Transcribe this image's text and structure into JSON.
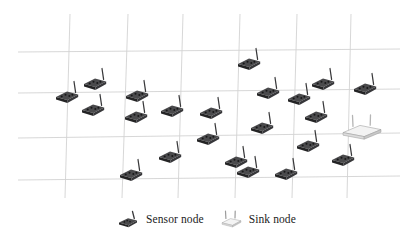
{
  "figure": {
    "type": "network-deployment-diagram",
    "background_color": "#ffffff",
    "grid": {
      "line_color": "#d2d2d2",
      "line_width": 0.9,
      "vertical_line_count": 6,
      "horizontal_line_count": 4,
      "perspective": "slight-skew",
      "vertical_lines": [
        {
          "x_top": 70,
          "y_top": 14,
          "x_bottom": 65,
          "y_bottom": 198
        },
        {
          "x_top": 128,
          "y_top": 14,
          "x_bottom": 122,
          "y_bottom": 198
        },
        {
          "x_top": 183,
          "y_top": 14,
          "x_bottom": 178,
          "y_bottom": 198
        },
        {
          "x_top": 240,
          "y_top": 14,
          "x_bottom": 235,
          "y_bottom": 198
        },
        {
          "x_top": 297,
          "y_top": 14,
          "x_bottom": 292,
          "y_bottom": 198
        },
        {
          "x_top": 351,
          "y_top": 14,
          "x_bottom": 347,
          "y_bottom": 198
        }
      ],
      "horizontal_lines": [
        {
          "x_left": 18,
          "y_left": 52,
          "x_right": 400,
          "y_right": 49
        },
        {
          "x_left": 18,
          "y_left": 93,
          "x_right": 400,
          "y_right": 89
        },
        {
          "x_left": 18,
          "y_left": 138,
          "x_right": 400,
          "y_right": 133
        },
        {
          "x_left": 18,
          "y_left": 180,
          "x_right": 400,
          "y_right": 176
        }
      ]
    },
    "sensor_nodes": {
      "label": "Sensor node",
      "count": 22,
      "body_color": "#2f2f30",
      "top_color": "#4a4a4c",
      "antenna_color": "#39393b",
      "positions": [
        {
          "x": 67,
          "y": 97,
          "id": "sensor-1"
        },
        {
          "x": 95,
          "y": 84,
          "id": "sensor-2"
        },
        {
          "x": 93,
          "y": 110,
          "id": "sensor-3"
        },
        {
          "x": 137,
          "y": 96,
          "id": "sensor-4"
        },
        {
          "x": 136,
          "y": 117,
          "id": "sensor-5"
        },
        {
          "x": 172,
          "y": 111,
          "id": "sensor-6"
        },
        {
          "x": 131,
          "y": 175,
          "id": "sensor-7"
        },
        {
          "x": 170,
          "y": 157,
          "id": "sensor-8"
        },
        {
          "x": 211,
          "y": 113,
          "id": "sensor-9"
        },
        {
          "x": 208,
          "y": 139,
          "id": "sensor-10"
        },
        {
          "x": 249,
          "y": 64,
          "id": "sensor-11"
        },
        {
          "x": 268,
          "y": 93,
          "id": "sensor-12"
        },
        {
          "x": 262,
          "y": 128,
          "id": "sensor-13"
        },
        {
          "x": 236,
          "y": 162,
          "id": "sensor-14"
        },
        {
          "x": 299,
          "y": 99,
          "id": "sensor-15"
        },
        {
          "x": 323,
          "y": 84,
          "id": "sensor-16"
        },
        {
          "x": 316,
          "y": 117,
          "id": "sensor-17"
        },
        {
          "x": 308,
          "y": 146,
          "id": "sensor-18"
        },
        {
          "x": 286,
          "y": 174,
          "id": "sensor-19"
        },
        {
          "x": 365,
          "y": 89,
          "id": "sensor-20"
        },
        {
          "x": 343,
          "y": 160,
          "id": "sensor-21"
        },
        {
          "x": 248,
          "y": 172,
          "id": "sensor-22"
        }
      ]
    },
    "sink_node": {
      "label": "Sink node",
      "count": 1,
      "body_color": "#f3f3f3",
      "edge_color": "#9a9a9a",
      "antenna_color": "#b5b5b5",
      "position": {
        "x": 362,
        "y": 132,
        "id": "sink-1"
      }
    },
    "legend": {
      "items": [
        {
          "icon": "sensor-node-icon",
          "label": "Sensor node"
        },
        {
          "icon": "sink-node-icon",
          "label": "Sink node"
        }
      ]
    }
  }
}
